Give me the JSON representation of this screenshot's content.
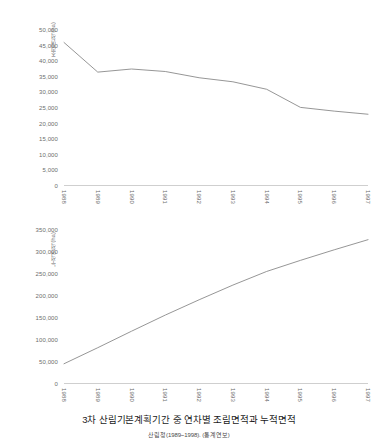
{
  "caption": {
    "title": "3차 산림기본계획기간 중 연차별 조림면적과 누적면적",
    "subtitle": "산림청(1989~1998). (통계연보)"
  },
  "chart_data": [
    {
      "type": "line",
      "id": "annual-afforestation",
      "title": "",
      "xlabel": "",
      "ylabel": "조림면적(ha)",
      "categories": [
        "1988",
        "1989",
        "1990",
        "1991",
        "1992",
        "1993",
        "1994",
        "1995",
        "1996",
        "1997"
      ],
      "series": [
        {
          "name": "조림면적(ha)",
          "values": [
            46000,
            36500,
            37500,
            36700,
            34700,
            33400,
            31000,
            25200,
            24000,
            23000
          ]
        }
      ],
      "ylim": [
        0,
        50000
      ],
      "yticks": [
        0,
        5000,
        10000,
        15000,
        20000,
        25000,
        30000,
        35000,
        40000,
        45000,
        50000
      ],
      "ytick_labels": [
        "0",
        "5,000",
        "10,000",
        "15,000",
        "20,000",
        "25,000",
        "30,000",
        "35,000",
        "40,000",
        "45,000",
        "50,000"
      ],
      "grid": false,
      "legend": "none",
      "line_color": "#8a8a8a"
    },
    {
      "type": "line",
      "id": "cumulative-afforestation",
      "title": "",
      "xlabel": "",
      "ylabel": "누적면적(ha)",
      "categories": [
        "1988",
        "1989",
        "1990",
        "1991",
        "1992",
        "1993",
        "1994",
        "1995",
        "1996",
        "1997"
      ],
      "series": [
        {
          "name": "누적면적(ha)",
          "values": [
            46000,
            82500,
            120000,
            156700,
            191400,
            224800,
            255800,
            281000,
            305000,
            328000
          ]
        }
      ],
      "ylim": [
        0,
        350000
      ],
      "yticks": [
        0,
        50000,
        100000,
        150000,
        200000,
        250000,
        300000,
        350000
      ],
      "ytick_labels": [
        "0",
        "50,000",
        "100,000",
        "150,000",
        "200,000",
        "250,000",
        "300,000",
        "350,000"
      ],
      "grid": false,
      "legend": "none",
      "line_color": "#8a8a8a"
    }
  ]
}
